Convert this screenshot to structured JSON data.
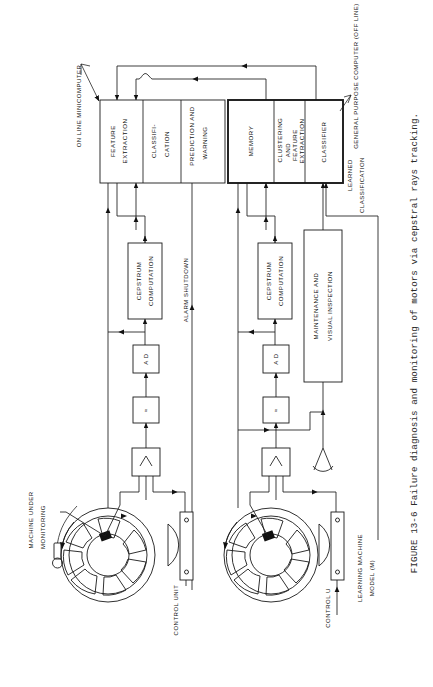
{
  "figure": {
    "caption": "FIGURE 13-6  Failure diagnosis and monitoring of motors via cepstral rays tracking."
  },
  "annotations": {
    "online_minicomputer": "ON LINE MINICOMPUTER",
    "general_purpose_computer": "GENERAL PURPOSE COMPUTER (OFF  LINE)",
    "learned_classification_1": "LEARNED",
    "learned_classification_2": "CLASSIFICATION",
    "alarm_shutdown": "ALARM SHUTDOWN",
    "machine_under_monitoring_1": "MACHINE  UNDER",
    "machine_under_monitoring_2": "MONITORING",
    "learning_machine": "LEARNING MACHINE",
    "learning_machine_model": "MODEL  (M)",
    "control_unit_left": "CONTROL UNIT",
    "control_unit_right": "CONTROL U"
  },
  "online_blocks": [
    {
      "name": "feature-extraction",
      "line1": "FEATURE",
      "line2": "EXTRACTION"
    },
    {
      "name": "classification",
      "line1": "CLASSIFI-",
      "line2": "CATION"
    },
    {
      "name": "prediction-and-warning",
      "line1": "PREDICTION AND",
      "line2": "WARNING"
    }
  ],
  "offline_blocks": [
    {
      "name": "memory",
      "line1": "MEMORY",
      "line2": ""
    },
    {
      "name": "clustering-and-feature-extraction",
      "line1": "CLUSTERING",
      "line2": "AND",
      "line3": "FEATURE",
      "line4": "EXTRACTION"
    },
    {
      "name": "classifier",
      "line1": "CLASSIFIER",
      "line2": ""
    }
  ],
  "signal_chain": {
    "cepstrum_1": "CEPSTRUM",
    "cepstrum_2": "COMPUTATION",
    "ad_converter": "A D",
    "filter_symbol": "≈",
    "amplifier_symbol": "∧"
  },
  "maintenance": {
    "line1": "MAINTENANCE AND",
    "line2": "VISUAL INSPECTION"
  },
  "icons": {
    "eye": "eye-inspection-icon",
    "motor": "motor-cross-section-icon",
    "sensor": "vibration-sensor-icon",
    "amplifier": "amplifier-icon",
    "filter": "filter-icon"
  },
  "colors": {
    "ink": "#1a1a1a",
    "paper": "#ffffff",
    "caption": "#2b2b2b"
  }
}
